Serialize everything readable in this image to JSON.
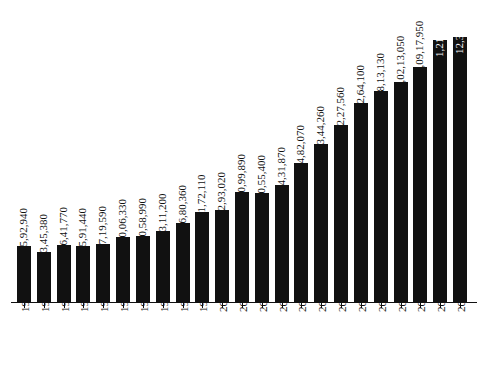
{
  "chart_data": {
    "type": "bar",
    "title": "",
    "subtitle": "",
    "xlabel": "",
    "ylabel": "",
    "grid": false,
    "legend": false,
    "bar_color": "#111111",
    "label_color_outside": "#111111",
    "label_color_inside": "#ffffff",
    "ylim": [
      0,
      12319750
    ],
    "categories": [
      "1990-91",
      "1991-92",
      "1992-93",
      "1993-94",
      "1994-95",
      "1995-96",
      "1996-97",
      "1997-98",
      "1998-99",
      "1999-00",
      "2000-01",
      "2001-02",
      "2002-03",
      "2003-04",
      "2004-05",
      "2005-06",
      "2006-07",
      "2007-08",
      "2008-09",
      "2009-10",
      "2010-11",
      "2011-12",
      "2012-13"
    ],
    "values": [
      2592940,
      2345380,
      2641770,
      2591440,
      2719590,
      3006330,
      3058990,
      3311200,
      3680360,
      4172110,
      4293020,
      5099890,
      5055400,
      5431870,
      6482070,
      7344260,
      8227560,
      9264100,
      9813130,
      10213050,
      10917950,
      12162660,
      12319750
    ],
    "value_labels": [
      "25,92,940",
      "23,45,380",
      "26,41,770",
      "25,91,440",
      "27,19,590",
      "30,06,330",
      "30,58,990",
      "33,11,200",
      "36,80,360",
      "41,72,110",
      "42,93,020",
      "50,99,890",
      "50,55,400",
      "54,31,870",
      "64,82,070",
      "73,44,260",
      "82,27,560",
      "92,64,100",
      "98,13,130",
      "1,02,13,050",
      "1,09,17,950",
      "1,21,62,660",
      "12,319,750"
    ],
    "label_placement": [
      "outside",
      "outside",
      "outside",
      "outside",
      "outside",
      "outside",
      "outside",
      "outside",
      "outside",
      "outside",
      "outside",
      "outside",
      "outside",
      "outside",
      "outside",
      "outside",
      "outside",
      "outside",
      "outside",
      "outside",
      "outside",
      "inside",
      "inside"
    ]
  }
}
